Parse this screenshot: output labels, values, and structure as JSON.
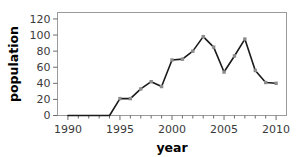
{
  "chart_data": {
    "type": "line",
    "title": "",
    "xlabel": "year",
    "ylabel": "population",
    "xlim": [
      1989,
      2011
    ],
    "ylim": [
      0,
      128
    ],
    "grid": false,
    "legend": false,
    "x": [
      1990,
      1991,
      1992,
      1993,
      1994,
      1995,
      1996,
      1997,
      1998,
      1999,
      2000,
      2001,
      2002,
      2003,
      2004,
      2005,
      2006,
      2007,
      2008,
      2009,
      2010
    ],
    "values": [
      0,
      0,
      0,
      0,
      0,
      21,
      21,
      33,
      42,
      36,
      69,
      70,
      80,
      98,
      85,
      54,
      74,
      95,
      56,
      41,
      40
    ],
    "series": [
      {
        "name": "population",
        "values": [
          0,
          0,
          0,
          0,
          0,
          21,
          21,
          33,
          42,
          36,
          69,
          70,
          80,
          98,
          85,
          54,
          74,
          95,
          56,
          41,
          40
        ]
      }
    ],
    "xticks": [
      1990,
      1995,
      2000,
      2005,
      2010
    ],
    "xtick_labels": [
      "1990",
      "1995",
      "2000",
      "2005",
      "2010"
    ],
    "yticks": [
      0,
      20,
      40,
      60,
      80,
      100,
      120
    ],
    "ytick_labels": [
      "0",
      "20",
      "40",
      "60",
      "80",
      "100",
      "120"
    ],
    "line_color": "#1a1a1a",
    "marker_color": "#8c8c8c",
    "frame_color": "#9a9a9a",
    "marker": "square"
  },
  "labels": {
    "x_axis": "year",
    "y_axis": "population"
  }
}
